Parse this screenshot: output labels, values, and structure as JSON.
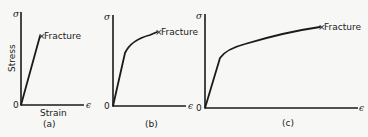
{
  "panels": [
    {
      "id": "a",
      "caption": "(a)",
      "y_symbol": "σ",
      "x_symbol": "ϵ",
      "origin": "0",
      "y_label": "Stress",
      "x_label": "Strain",
      "end_label": "Fracture",
      "end_marker": "×"
    },
    {
      "id": "b",
      "caption": "(b)",
      "y_symbol": "σ",
      "x_symbol": "ϵ",
      "origin": "0",
      "end_label": "Fracture",
      "end_marker": "×"
    },
    {
      "id": "c",
      "caption": "(c)",
      "y_symbol": "σ",
      "x_symbol": "ϵ",
      "origin": "0",
      "end_label": "Fracture",
      "end_marker": "×"
    }
  ]
}
